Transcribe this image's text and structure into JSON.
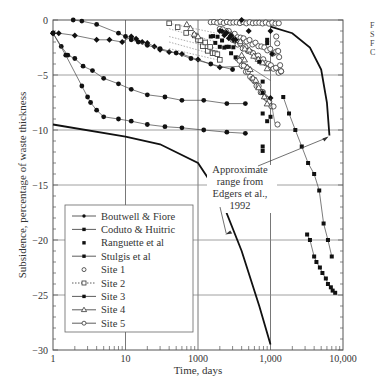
{
  "chart_data": {
    "type": "scatter",
    "title": "",
    "xlabel": "Time, days",
    "ylabel": "Subsidence, percentage of waste thickness",
    "xscale": "log",
    "xlim": [
      1,
      10000
    ],
    "ylim": [
      -30,
      0
    ],
    "x_tick_labels": [
      "1",
      "10",
      "1000",
      "1,000",
      "10,000"
    ],
    "x_tick_values": [
      1,
      10,
      100,
      1000,
      10000
    ],
    "y_tick_labels": [
      "0",
      "-5",
      "-10",
      "-15",
      "-20",
      "-25",
      "-30"
    ],
    "y_tick_values": [
      0,
      -5,
      -10,
      -15,
      -20,
      -25,
      -30
    ],
    "grid": true,
    "legend_position": "lower left",
    "legend": [
      {
        "label": "Boutwell & Fiore",
        "marker": "filled-circle",
        "line": "solid"
      },
      {
        "label": "Coduto & Huitric",
        "marker": "filled-square",
        "line": "solid"
      },
      {
        "label": "Ranguette et al",
        "marker": "filled-square",
        "line": "none"
      },
      {
        "label": "Stulgis et al",
        "marker": "filled-diamond",
        "line": "solid"
      },
      {
        "label": "Site 1",
        "marker": "open-circle",
        "line": "none"
      },
      {
        "label": "Site 2",
        "marker": "open-square",
        "line": "dotted"
      },
      {
        "label": "Site 3",
        "marker": "filled-diamond",
        "line": "solid"
      },
      {
        "label": "Site 4",
        "marker": "open-triangle",
        "line": "solid"
      },
      {
        "label": "Site 5",
        "marker": "open-circle",
        "line": "solid"
      }
    ],
    "annotations": [
      {
        "text": [
          "Approximate",
          "range from",
          "Edgers et al.,",
          "1992"
        ],
        "arrows_to": [
          "upper bound curve at ~6500 days, -10.5%",
          "lower bound curve at ~230 days, -19.5%"
        ]
      }
    ],
    "series": [
      {
        "name": "Boutwell & Fiore (curve A)",
        "x": [
          1,
          1.3,
          1.6,
          2,
          2.6,
          3.5,
          5,
          8,
          12,
          20,
          35,
          60,
          120,
          250,
          450
        ],
        "y": [
          -1.2,
          -2.4,
          -3.2,
          -3.5,
          -4.2,
          -4.6,
          -5.3,
          -5.8,
          -6.3,
          -6.8,
          -7.0,
          -7.3,
          -7.3,
          -7.6,
          -7.6
        ]
      },
      {
        "name": "Boutwell & Fiore (curve B)",
        "x": [
          1,
          1.5,
          2.5,
          3,
          3.3,
          4,
          5,
          8,
          12,
          20,
          35,
          60,
          120,
          250,
          450
        ],
        "y": [
          -1.2,
          -3.2,
          -6.0,
          -7.0,
          -7.5,
          -8.2,
          -8.8,
          -9.0,
          -9.2,
          -9.5,
          -9.7,
          -9.8,
          -10.0,
          -10.2,
          -10.3
        ]
      },
      {
        "name": "Stulgis et al",
        "x": [
          1,
          1.2,
          2,
          4,
          6,
          9,
          12,
          14,
          17,
          20,
          25,
          30,
          40,
          60,
          100,
          200,
          400
        ],
        "y": [
          -1.2,
          -1.2,
          -1.4,
          -1.8,
          -1.8,
          -2.0,
          -1.5,
          -1.7,
          -2.0,
          -2.1,
          -2.4,
          -2.7,
          -2.9,
          -3.1,
          -3.6,
          -4.3,
          -4.2
        ]
      },
      {
        "name": "Coduto & Huitric",
        "x": [
          1.9,
          2.5,
          4,
          8,
          10,
          12,
          15,
          20,
          30,
          50,
          80,
          150,
          300
        ],
        "y": [
          0,
          -0.1,
          -0.4,
          -1.2,
          -1.5,
          -1.8,
          -2.0,
          -2.3,
          -2.6,
          -3.0,
          -3.5,
          -4.0,
          -4.5
        ]
      },
      {
        "name": "Site 3",
        "x": [
          1500,
          1800,
          2200,
          2700,
          3300,
          4000,
          4700,
          5400,
          6200,
          7000
        ],
        "y": [
          -7.0,
          -8.5,
          -10.0,
          -11.5,
          -13.0,
          -14.0,
          -15.5,
          -18.5,
          -20.0,
          -21.5
        ]
      },
      {
        "name": "Ranguette et al",
        "x": [
          3200,
          3500,
          4000,
          4300,
          4800,
          5200,
          5800,
          6200,
          6800,
          7200,
          7800
        ],
        "y": [
          -19.5,
          -20.0,
          -21.5,
          -22.0,
          -22.5,
          -23.0,
          -23.5,
          -24.0,
          -24.3,
          -24.6,
          -24.8
        ]
      },
      {
        "name": "Edgers upper bound",
        "x": [
          1000,
          2000,
          3500,
          5000,
          6000,
          6500
        ],
        "y": [
          -0.6,
          -1.2,
          -2.5,
          -4.5,
          -7.5,
          -10.5
        ]
      },
      {
        "name": "Edgers lower bound",
        "x": [
          1,
          10,
          30,
          100,
          200,
          400,
          700,
          1000
        ],
        "y": [
          -9.5,
          -10.6,
          -11.3,
          -13.0,
          -16.0,
          -21.0,
          -26.0,
          -29.5
        ]
      }
    ]
  },
  "corner_labels": [
    "F",
    "S",
    "F",
    "C"
  ]
}
